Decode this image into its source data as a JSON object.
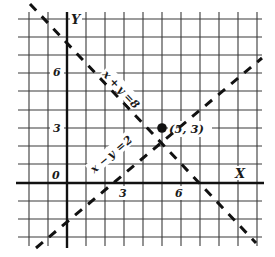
{
  "figure": {
    "type": "coordinate-graph",
    "axes": {
      "x_label": "X",
      "y_label": "Y",
      "origin_label": "0",
      "x_ticks": [
        {
          "value": 3,
          "label": "3"
        },
        {
          "value": 6,
          "label": "6"
        }
      ],
      "y_ticks": [
        {
          "value": 3,
          "label": "3"
        },
        {
          "value": 6,
          "label": "6"
        }
      ],
      "x_range": [
        -2,
        10
      ],
      "y_range": [
        -3,
        9
      ],
      "grid": true
    },
    "lines": [
      {
        "name": "line-x-plus-y",
        "equation": "x + y = 8",
        "label_parts": [
          "x",
          "+",
          "y",
          "=",
          "8"
        ],
        "style": "dashed"
      },
      {
        "name": "line-x-minus-y",
        "equation": "x − y = 2",
        "label_parts": [
          "x",
          "−",
          "y",
          "=",
          "2"
        ],
        "style": "dashed"
      }
    ],
    "intersection": {
      "x": 5,
      "y": 3,
      "label": "(5, 3)"
    },
    "colors": {
      "ink": "#1a1a1a",
      "grid": "#3a3a3a",
      "background": "#ffffff"
    }
  }
}
